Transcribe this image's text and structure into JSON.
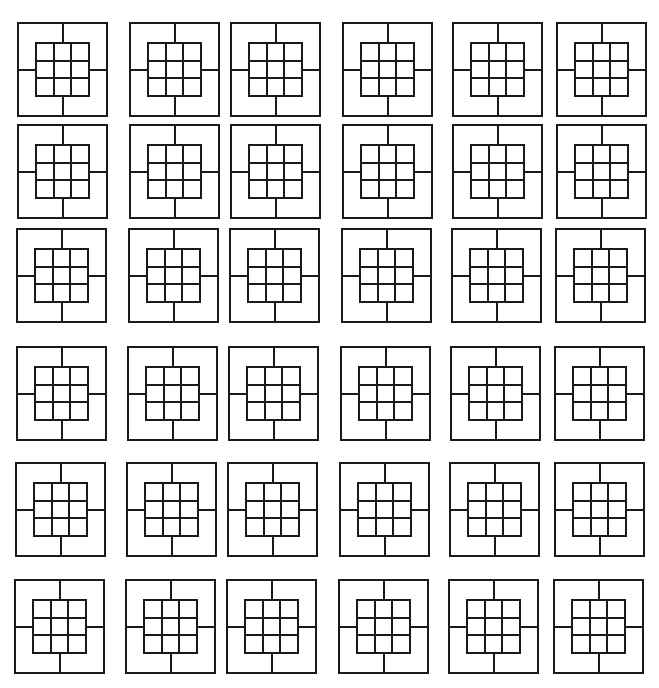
{
  "figure": {
    "width": 659,
    "height": 688,
    "background": "#ffffff",
    "stroke_color": "#1a1a1a",
    "rows": 6,
    "cols": 6,
    "tile_pattern": {
      "description": "Outer square with four spokes (top, bottom, left, right) joining an inner 3x3 grid of squares",
      "inner_grid": [
        3,
        3
      ],
      "inner_inset_ratio": {
        "left": 0.2,
        "right": 0.2,
        "top": 0.22,
        "bottom": 0.22
      }
    },
    "column_x": [
      [
        18,
        130,
        231,
        343,
        453,
        557
      ],
      [
        18,
        130,
        231,
        343,
        453,
        557
      ],
      [
        17,
        129,
        230,
        342,
        452,
        556
      ],
      [
        17,
        128,
        229,
        341,
        451,
        555
      ],
      [
        16,
        127,
        228,
        340,
        450,
        555
      ],
      [
        15,
        126,
        227,
        339,
        449,
        554
      ]
    ],
    "row_y": [
      23,
      125,
      229,
      347,
      463,
      580
    ],
    "tile_width": 89,
    "tile_height": 93
  }
}
